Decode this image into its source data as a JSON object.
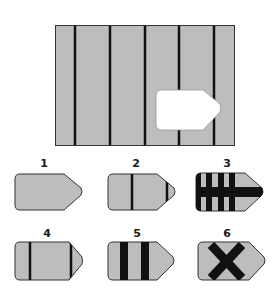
{
  "puzzle": {
    "type": "missing-piece",
    "main_panel": {
      "fill": "#bdbdbd",
      "line_color": "#111111",
      "vertical_lines_x": [
        75,
        110,
        145,
        179,
        214
      ],
      "cutout": "white arrow-tag shaped hole, bottom-right area"
    },
    "options": [
      {
        "label": "1",
        "pattern": "plain"
      },
      {
        "label": "2",
        "pattern": "two-thin-vertical-lines"
      },
      {
        "label": "3",
        "pattern": "vertical-bars-with-horizontal-bar"
      },
      {
        "label": "4",
        "pattern": "two-thin-vertical-lines-edges"
      },
      {
        "label": "5",
        "pattern": "two-thick-vertical-bars"
      },
      {
        "label": "6",
        "pattern": "black-x"
      }
    ]
  },
  "colors": {
    "shape_fill": "#bdbdbd",
    "ink": "#111111",
    "background": "#ffffff"
  }
}
